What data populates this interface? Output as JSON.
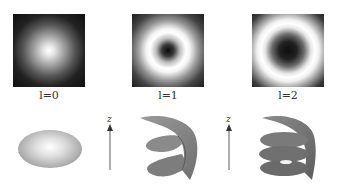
{
  "figure": {
    "panels": [
      {
        "label": "l=0",
        "pattern": "gaussian-spot",
        "shape": "ellipsoid"
      },
      {
        "label": "l=1",
        "pattern": "donut-ring-small",
        "shape": "single-helix"
      },
      {
        "label": "l=2",
        "pattern": "donut-ring-large",
        "shape": "double-helix"
      }
    ],
    "axis_label": "z",
    "colors": {
      "background": "#ffffff",
      "dark": "#111111",
      "bright": "#ffffff",
      "surface": "#8a8a8a"
    }
  }
}
